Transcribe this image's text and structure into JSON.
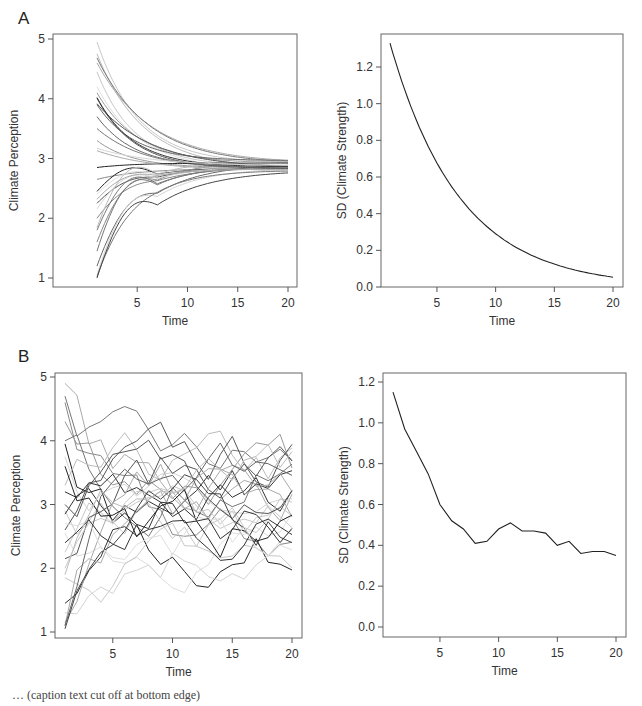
{
  "figure": {
    "panel_labels": [
      "A",
      "B"
    ],
    "caption_fragment": "… (caption text cut off at bottom edge)"
  },
  "chart_data": [
    {
      "id": "A-left",
      "panel": "A",
      "type": "line",
      "title": "",
      "xlabel": "Time",
      "ylabel": "Climate Perception",
      "xlim": [
        1,
        20
      ],
      "ylim": [
        1,
        5
      ],
      "xticks": [
        5,
        10,
        15,
        20
      ],
      "yticks": [
        1,
        2,
        3,
        4,
        5
      ],
      "grid": false,
      "legend": null,
      "description": "~30 grayscale individual trajectories starting between 1 and 5 at Time 1 and converging smoothly to ~2.8–3.0 by Time 20",
      "series_start_values": [
        4.95,
        4.75,
        4.6,
        4.45,
        4.2,
        4.1,
        3.9,
        3.7,
        3.5,
        3.3,
        2.85,
        2.65,
        2.45,
        2.4,
        2.25,
        2.0,
        1.8,
        1.6,
        1.45,
        1.2,
        1.05,
        1.02
      ],
      "converged_value": 2.9
    },
    {
      "id": "A-right",
      "panel": "A",
      "type": "line",
      "title": "",
      "xlabel": "Time",
      "ylabel": "SD (Climate Strength)",
      "xlim": [
        1,
        20
      ],
      "ylim": [
        0,
        1.3
      ],
      "xticks": [
        5,
        10,
        15,
        20
      ],
      "yticks": [
        0.0,
        0.2,
        0.4,
        0.6,
        0.8,
        1.0,
        1.2
      ],
      "grid": false,
      "legend": null,
      "x": [
        1,
        2,
        3,
        4,
        5,
        6,
        7,
        8,
        9,
        10,
        11,
        12,
        13,
        14,
        15,
        16,
        17,
        18,
        19,
        20
      ],
      "values": [
        1.33,
        1.05,
        0.84,
        0.69,
        0.56,
        0.46,
        0.38,
        0.32,
        0.27,
        0.23,
        0.2,
        0.17,
        0.15,
        0.13,
        0.115,
        0.1,
        0.09,
        0.075,
        0.065,
        0.055
      ]
    },
    {
      "id": "B-left",
      "panel": "B",
      "type": "line",
      "title": "",
      "xlabel": "Time",
      "ylabel": "Climate Perception",
      "xlim": [
        1,
        20
      ],
      "ylim": [
        1,
        5
      ],
      "xticks": [
        5,
        10,
        15,
        20
      ],
      "yticks": [
        1,
        2,
        3,
        4,
        5
      ],
      "grid": false,
      "legend": null,
      "description": "~30 grayscale noisy individual trajectories starting between 1 and 5, settling into a band of ~2–3.8 with persistent fluctuation"
    },
    {
      "id": "B-right",
      "panel": "B",
      "type": "line",
      "title": "",
      "xlabel": "Time",
      "ylabel": "SD (Climate Strength)",
      "xlim": [
        1,
        20
      ],
      "ylim": [
        0,
        1.2
      ],
      "xticks": [
        5,
        10,
        15,
        20
      ],
      "yticks": [
        0.0,
        0.2,
        0.4,
        0.6,
        0.8,
        1.0,
        1.2
      ],
      "grid": false,
      "legend": null,
      "x": [
        1,
        2,
        3,
        4,
        5,
        6,
        7,
        8,
        9,
        10,
        11,
        12,
        13,
        14,
        15,
        16,
        17,
        18,
        19,
        20
      ],
      "values": [
        1.15,
        0.97,
        0.86,
        0.75,
        0.6,
        0.52,
        0.48,
        0.41,
        0.42,
        0.48,
        0.51,
        0.47,
        0.47,
        0.46,
        0.4,
        0.42,
        0.36,
        0.37,
        0.37,
        0.35
      ]
    }
  ]
}
